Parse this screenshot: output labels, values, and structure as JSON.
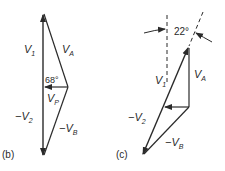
{
  "diagram_b": {
    "label": "(b)",
    "v1": "V",
    "v1_sub": "1",
    "va": "V",
    "va_sub": "A",
    "angle": "68°",
    "vp": "V",
    "vp_sub": "P",
    "neg_v2": "−V",
    "neg_v2_sub": "2",
    "neg_vb": "−V",
    "neg_vb_sub": "B"
  },
  "diagram_c": {
    "label": "(c)",
    "angle": "22°",
    "v1": "V",
    "v1_sub": "1",
    "va": "V",
    "va_sub": "A",
    "neg_v2": "−V",
    "neg_v2_sub": "2",
    "neg_vb": "−V",
    "neg_vb_sub": "B"
  },
  "colors": {
    "ink": "#2a2a2a",
    "background": "#ffffff"
  }
}
